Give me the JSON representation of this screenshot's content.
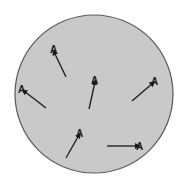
{
  "diagram": {
    "container": {
      "shape": "circle",
      "cx": 94,
      "cy": 94,
      "r": 79,
      "fill": "#c9c9c9",
      "stroke": "#5a5a5a"
    },
    "particles": [
      {
        "label": "A",
        "x1": 66,
        "y1": 77,
        "x2": 54,
        "y2": 52,
        "lx": 50,
        "ly": 53
      },
      {
        "label": "A",
        "x1": 89,
        "y1": 109,
        "x2": 95,
        "y2": 82,
        "lx": 91,
        "ly": 84
      },
      {
        "label": "A",
        "x1": 46,
        "y1": 108,
        "x2": 24,
        "y2": 91,
        "lx": 18,
        "ly": 93
      },
      {
        "label": "A",
        "x1": 132,
        "y1": 101,
        "x2": 153,
        "y2": 83,
        "lx": 151,
        "ly": 85
      },
      {
        "label": "A",
        "x1": 66,
        "y1": 158,
        "x2": 79,
        "y2": 135,
        "lx": 76,
        "ly": 137
      },
      {
        "label": "A",
        "x1": 107,
        "y1": 146,
        "x2": 138,
        "y2": 146,
        "lx": 136,
        "ly": 150
      }
    ]
  }
}
